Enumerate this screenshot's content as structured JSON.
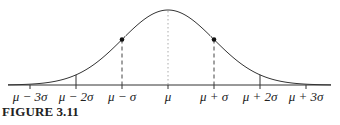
{
  "caption": "FIGURE 3.11",
  "chart_data": {
    "type": "line",
    "title": "",
    "xlabel": "",
    "ylabel": "",
    "x_ticks": [
      "μ − 3σ",
      "μ − 2σ",
      "μ − σ",
      "μ",
      "μ + σ",
      "μ + 2σ",
      "μ + 3σ"
    ],
    "x_tick_values": [
      -3,
      -2,
      -1,
      0,
      1,
      2,
      3
    ],
    "xlim": [
      -3.5,
      3.5
    ],
    "series": [
      {
        "name": "normal density (relative)",
        "x": [
          -3,
          -2,
          -1,
          0,
          1,
          2,
          3
        ],
        "values": [
          0.011,
          0.135,
          0.607,
          1.0,
          0.607,
          0.135,
          0.011
        ]
      }
    ],
    "marked_points": [
      {
        "x": -1,
        "y": 0.607,
        "label": "inflection point"
      },
      {
        "x": 1,
        "y": 0.607,
        "label": "inflection point"
      }
    ],
    "annotations": {
      "mean_line": "dotted vertical at μ",
      "sigma_lines": "dashed verticals at μ ± σ",
      "solid_ticks": "solid short verticals at μ ± 2σ up to curve"
    },
    "grid": false,
    "legend": null
  },
  "layout": {
    "x0": 168,
    "unit": 46,
    "baseline": 85,
    "peak_height": 75,
    "axis_left": 8,
    "axis_right": 331,
    "curve_color": "#333333"
  }
}
